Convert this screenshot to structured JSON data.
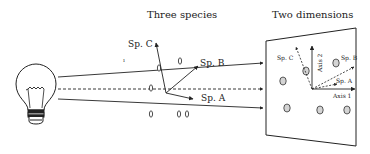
{
  "titles": {
    "left": "Three species",
    "right": "Two dimensions"
  },
  "left_panel": {
    "vectors": [
      {
        "label": "Sp. C",
        "style": "solid"
      },
      {
        "label": "Sp. B",
        "style": "solid"
      },
      {
        "label": "Sp. A",
        "style": "solid"
      }
    ],
    "sample_points": 7
  },
  "right_panel": {
    "axes": [
      {
        "label": "Axis 1"
      },
      {
        "label": "Axis 2"
      }
    ],
    "projected_vectors": [
      {
        "label": "Sp. C",
        "style": "dashed"
      },
      {
        "label": "Sp. B",
        "style": "dashed"
      },
      {
        "label": "Sp. A",
        "style": "dashed"
      }
    ],
    "projected_points": 6
  },
  "light_source": {
    "icon": "light-bulb-icon"
  },
  "colors": {
    "stroke": "#222222",
    "point_fill": "#cfcfcf",
    "background": "#ffffff"
  }
}
